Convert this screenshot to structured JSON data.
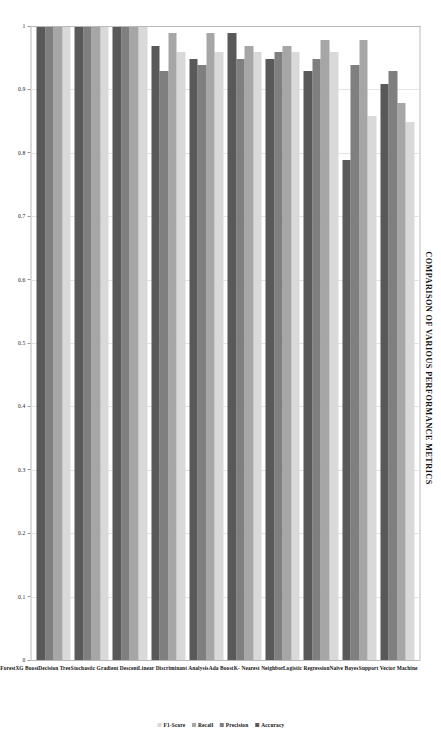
{
  "chart_data": {
    "type": "bar",
    "orientation": "horizontal",
    "title": "COMPARISON OF VARIOUS PERFORMANCE METRICS",
    "xlabel": "",
    "ylabel": "",
    "xlim": [
      1,
      0
    ],
    "x_axis_reversed": true,
    "grid": true,
    "legend_position": "right",
    "tick_labels": [
      "1",
      "0.9",
      "0.8",
      "0.7",
      "0.6",
      "0.5",
      "0.4",
      "0.3",
      "0.2",
      "0.1",
      "0"
    ],
    "tick_values": [
      1,
      0.9,
      0.8,
      0.7,
      0.6,
      0.5,
      0.4,
      0.3,
      0.2,
      0.1,
      0
    ],
    "categories": [
      "Support Vector Machine",
      "Naive Bayes",
      "Logistic Regression",
      "K- Nearest Neighbor",
      "Ada Boost",
      "Linear Discriminant Analysis",
      "Stochastic Gradient Descent",
      "Decision Tree",
      "XG Boost",
      "Random Forest"
    ],
    "series": [
      {
        "name": "Accuracy",
        "color": "#595959",
        "values": [
          0.91,
          0.79,
          0.93,
          0.95,
          0.99,
          0.95,
          0.97,
          1.0,
          1.0,
          1.0
        ]
      },
      {
        "name": "Precision",
        "color": "#7f7f7f",
        "values": [
          0.93,
          0.94,
          0.95,
          0.96,
          0.95,
          0.94,
          0.93,
          1.0,
          1.0,
          1.0
        ]
      },
      {
        "name": "Recall",
        "color": "#a6a6a6",
        "values": [
          0.88,
          0.98,
          0.98,
          0.97,
          0.97,
          0.99,
          0.99,
          1.0,
          1.0,
          1.0
        ]
      },
      {
        "name": "F1-Score",
        "color": "#d9d9d9",
        "values": [
          0.85,
          0.86,
          0.96,
          0.96,
          0.96,
          0.96,
          0.96,
          1.0,
          1.0,
          1.0
        ]
      }
    ]
  }
}
